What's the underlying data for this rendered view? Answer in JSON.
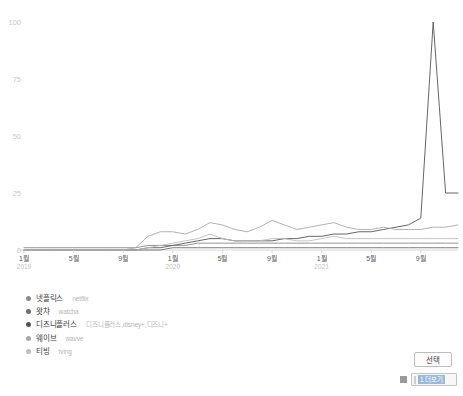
{
  "chart_data": {
    "type": "line",
    "title": "",
    "xlabel": "",
    "ylabel": "",
    "ylim": [
      0,
      100
    ],
    "yticks": [
      "0",
      "25",
      "50",
      "75",
      "100"
    ],
    "grid": false,
    "legend_position": "bottom-left",
    "x": [
      "2019-01",
      "2019-02",
      "2019-03",
      "2019-04",
      "2019-05",
      "2019-06",
      "2019-07",
      "2019-08",
      "2019-09",
      "2019-10",
      "2019-11",
      "2019-12",
      "2020-01",
      "2020-02",
      "2020-03",
      "2020-04",
      "2020-05",
      "2020-06",
      "2020-07",
      "2020-08",
      "2020-09",
      "2020-10",
      "2020-11",
      "2020-12",
      "2021-01",
      "2021-02",
      "2021-03",
      "2021-04",
      "2021-05",
      "2021-06",
      "2021-07",
      "2021-08",
      "2021-09",
      "2021-10",
      "2021-11",
      "2021-12"
    ],
    "xtick_months": [
      "1월",
      "5월",
      "9월",
      "1월",
      "5월",
      "9월",
      "1월",
      "5월",
      "9월"
    ],
    "xtick_years": [
      "2019",
      "",
      "",
      "2020",
      "",
      "",
      "2021",
      "",
      ""
    ],
    "series": [
      {
        "name": "넷플릭스",
        "keywords": "netflix",
        "color": "#8a8a8a",
        "values": [
          1,
          1,
          1,
          1,
          1,
          1,
          1,
          1,
          1,
          1,
          2,
          2,
          2,
          2,
          3,
          3,
          3,
          3,
          3,
          3,
          3,
          3,
          3,
          3,
          3,
          3,
          3,
          3,
          3,
          3,
          3,
          3,
          3,
          3,
          3,
          3
        ]
      },
      {
        "name": "왓챠",
        "keywords": "watcha",
        "color": "#6e6e6e",
        "values": [
          0,
          0,
          0,
          0,
          0,
          0,
          0,
          0,
          0,
          0,
          0,
          0,
          1,
          1,
          1,
          1,
          1,
          1,
          1,
          1,
          1,
          1,
          1,
          1,
          1,
          1,
          1,
          1,
          1,
          1,
          1,
          1,
          1,
          1,
          1,
          1
        ]
      },
      {
        "name": "디즈니플러스",
        "keywords": "디즈니플러스,disney+,디즈니+",
        "color": "#555555",
        "values": [
          0,
          0,
          0,
          0,
          0,
          0,
          0,
          0,
          0,
          0,
          1,
          1,
          2,
          3,
          4,
          5,
          5,
          4,
          4,
          4,
          4,
          5,
          5,
          6,
          6,
          7,
          7,
          8,
          8,
          9,
          10,
          11,
          14,
          100,
          25,
          25
        ]
      },
      {
        "name": "웨이브",
        "keywords": "wavve",
        "color": "#a8a8a8",
        "values": [
          0,
          0,
          0,
          0,
          0,
          0,
          0,
          0,
          0,
          1,
          6,
          8,
          8,
          7,
          9,
          12,
          11,
          9,
          8,
          10,
          13,
          11,
          9,
          10,
          11,
          12,
          10,
          9,
          9,
          10,
          9,
          9,
          9,
          10,
          10,
          11
        ]
      },
      {
        "name": "티빙",
        "keywords": "tving",
        "color": "#bdbdbd",
        "values": [
          0,
          0,
          0,
          0,
          0,
          0,
          0,
          0,
          0,
          0,
          1,
          2,
          3,
          4,
          5,
          7,
          5,
          4,
          4,
          4,
          5,
          5,
          4,
          4,
          5,
          6,
          5,
          5,
          5,
          5,
          5,
          5,
          5,
          5,
          5,
          5
        ]
      }
    ]
  },
  "controls": {
    "select_button_label": "선택",
    "combo_value": "1 더보기",
    "combo_icon": "grid-icon"
  }
}
